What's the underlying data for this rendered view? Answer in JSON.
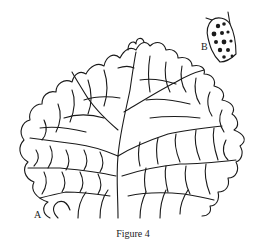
{
  "figure": {
    "caption": "Figure 4",
    "panels": [
      {
        "id": "A",
        "label": "A",
        "description": "fan-shaped cellular thallus drawing"
      },
      {
        "id": "B",
        "label": "B",
        "description": "single cell with granular contents"
      }
    ]
  }
}
